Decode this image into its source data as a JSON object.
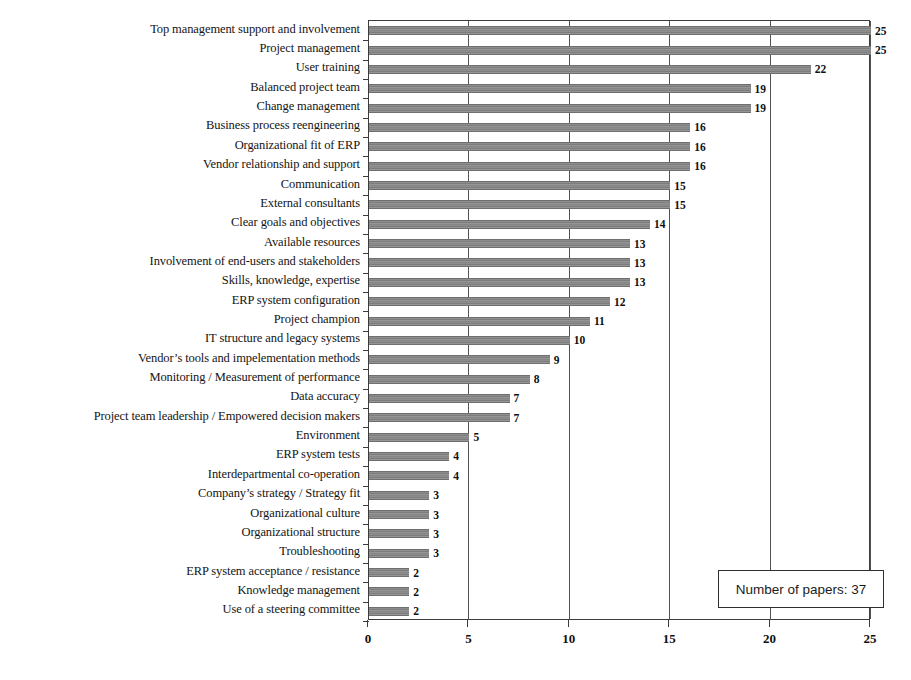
{
  "chart_data": {
    "type": "bar",
    "orientation": "horizontal",
    "title": "",
    "subtitle": "",
    "xlabel": "",
    "ylabel": "",
    "xlim": [
      0,
      25
    ],
    "ylim": null,
    "grid": true,
    "legend_position": "none",
    "xticks": [
      "0",
      "5",
      "10",
      "15",
      "20",
      "25"
    ],
    "xtick_values": [
      0,
      5,
      10,
      15,
      20,
      25
    ],
    "annotation": "Number of papers: 37",
    "bar_color": "#8d8d8d",
    "axis_color": "#3c3c3c",
    "categories": [
      "Top management support and involvement",
      "Project management",
      "User training",
      "Balanced project team",
      "Change management",
      "Business process reengineering",
      "Organizational fit of ERP",
      "Vendor relationship and support",
      "Communication",
      "External consultants",
      "Clear goals and objectives",
      "Available resources",
      "Involvement of end-users and stakeholders",
      "Skills, knowledge, expertise",
      "ERP system configuration",
      "Project champion",
      "IT structure and legacy systems",
      "Vendor’s tools and impelementation methods",
      "Monitoring / Measurement of performance",
      "Data accuracy",
      "Project team leadership / Empowered decision makers",
      "Environment",
      "ERP system tests",
      "Interdepartmental co-operation",
      "Company’s strategy / Strategy fit",
      "Organizational culture",
      "Organizational structure",
      "Troubleshooting",
      "ERP system acceptance / resistance",
      "Knowledge management",
      "Use of a steering committee"
    ],
    "values": [
      25,
      25,
      22,
      19,
      19,
      16,
      16,
      16,
      15,
      15,
      14,
      13,
      13,
      13,
      12,
      11,
      10,
      9,
      8,
      7,
      7,
      5,
      4,
      4,
      3,
      3,
      3,
      3,
      2,
      2,
      2
    ],
    "value_labels": [
      "25",
      "25",
      "22",
      "19",
      "19",
      "16",
      "16",
      "16",
      "15",
      "15",
      "14",
      "13",
      "13",
      "13",
      "12",
      "11",
      "10",
      "9",
      "8",
      "7",
      "7",
      "5",
      "4",
      "4",
      "3",
      "3",
      "3",
      "3",
      "2",
      "2",
      "2"
    ]
  }
}
